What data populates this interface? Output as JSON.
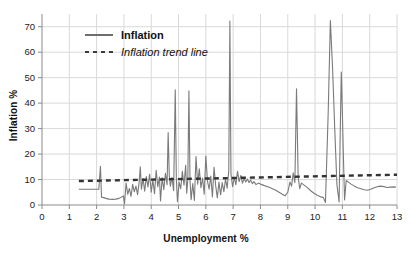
{
  "chart_data": {
    "type": "line",
    "title": "",
    "xlabel": "Unemployment %",
    "ylabel": "Inflation %",
    "xlim": [
      0,
      13
    ],
    "ylim": [
      0,
      75
    ],
    "xticks": [
      0,
      1,
      2,
      3,
      4,
      5,
      6,
      7,
      8,
      9,
      10,
      11,
      12,
      13
    ],
    "yticks": [
      0,
      10,
      20,
      30,
      40,
      50,
      60,
      70
    ],
    "grid": true,
    "legend_position": "upper-left",
    "legend": [
      {
        "label": "Inflation",
        "style": "solid",
        "color": "#6e6e6e",
        "weight": "bold"
      },
      {
        "label": "Inflation trend line",
        "style": "dotted",
        "color": "#3a3a3a",
        "weight": "italic"
      }
    ],
    "series": [
      {
        "name": "Inflation",
        "style": "solid",
        "color": "#7a7a7a",
        "points": [
          [
            1.35,
            6.2
          ],
          [
            1.55,
            6.2
          ],
          [
            1.75,
            6.2
          ],
          [
            1.95,
            6.2
          ],
          [
            2.08,
            6.2
          ],
          [
            2.14,
            15.2
          ],
          [
            2.18,
            3.1
          ],
          [
            2.26,
            2.9
          ],
          [
            2.34,
            2.6
          ],
          [
            2.45,
            2.3
          ],
          [
            2.58,
            2.2
          ],
          [
            2.7,
            2.3
          ],
          [
            2.82,
            2.6
          ],
          [
            2.93,
            3.2
          ],
          [
            2.98,
            3.6
          ],
          [
            3.02,
            0.4
          ],
          [
            3.08,
            8.6
          ],
          [
            3.14,
            4.2
          ],
          [
            3.2,
            6.5
          ],
          [
            3.26,
            3.4
          ],
          [
            3.32,
            8.1
          ],
          [
            3.38,
            5.2
          ],
          [
            3.44,
            7.4
          ],
          [
            3.5,
            4.1
          ],
          [
            3.56,
            9.2
          ],
          [
            3.6,
            15.0
          ],
          [
            3.64,
            6.2
          ],
          [
            3.7,
            10.4
          ],
          [
            3.76,
            5.4
          ],
          [
            3.82,
            11.2
          ],
          [
            3.88,
            7.1
          ],
          [
            3.94,
            12.1
          ],
          [
            4.0,
            5.0
          ],
          [
            4.06,
            9.8
          ],
          [
            4.12,
            4.4
          ],
          [
            4.18,
            13.6
          ],
          [
            4.24,
            7.2
          ],
          [
            4.3,
            11.0
          ],
          [
            4.34,
            1.6
          ],
          [
            4.4,
            10.8
          ],
          [
            4.46,
            6.0
          ],
          [
            4.52,
            12.4
          ],
          [
            4.58,
            8.0
          ],
          [
            4.62,
            28.4
          ],
          [
            4.66,
            12.0
          ],
          [
            4.7,
            7.4
          ],
          [
            4.76,
            10.9
          ],
          [
            4.82,
            5.6
          ],
          [
            4.88,
            45.2
          ],
          [
            4.92,
            10.2
          ],
          [
            4.96,
            1.3
          ],
          [
            5.02,
            9.0
          ],
          [
            5.08,
            6.4
          ],
          [
            5.14,
            13.2
          ],
          [
            5.2,
            7.8
          ],
          [
            5.26,
            15.6
          ],
          [
            5.3,
            4.6
          ],
          [
            5.34,
            10.0
          ],
          [
            5.38,
            44.8
          ],
          [
            5.42,
            9.5
          ],
          [
            5.46,
            2.1
          ],
          [
            5.52,
            8.4
          ],
          [
            5.58,
            1.8
          ],
          [
            5.64,
            19.0
          ],
          [
            5.7,
            8.2
          ],
          [
            5.76,
            14.2
          ],
          [
            5.82,
            6.8
          ],
          [
            5.88,
            10.6
          ],
          [
            5.94,
            4.2
          ],
          [
            6.0,
            19.2
          ],
          [
            6.06,
            9.4
          ],
          [
            6.12,
            6.2
          ],
          [
            6.18,
            11.4
          ],
          [
            6.24,
            3.2
          ],
          [
            6.3,
            14.8
          ],
          [
            6.36,
            7.6
          ],
          [
            6.42,
            2.8
          ],
          [
            6.48,
            9.0
          ],
          [
            6.54,
            4.0
          ],
          [
            6.6,
            8.8
          ],
          [
            6.66,
            5.2
          ],
          [
            6.72,
            10.2
          ],
          [
            6.78,
            6.6
          ],
          [
            6.84,
            13.4
          ],
          [
            6.88,
            72.2
          ],
          [
            6.92,
            12.0
          ],
          [
            6.98,
            7.2
          ],
          [
            7.04,
            10.8
          ],
          [
            7.1,
            8.0
          ],
          [
            7.16,
            13.2
          ],
          [
            7.22,
            9.2
          ],
          [
            7.28,
            11.6
          ],
          [
            7.34,
            8.6
          ],
          [
            7.4,
            10.4
          ],
          [
            7.46,
            9.0
          ],
          [
            7.52,
            10.2
          ],
          [
            7.58,
            8.8
          ],
          [
            7.64,
            9.8
          ],
          [
            7.7,
            8.4
          ],
          [
            7.76,
            9.2
          ],
          [
            7.84,
            8.0
          ],
          [
            7.92,
            8.6
          ],
          [
            8.0,
            8.2
          ],
          [
            8.1,
            7.8
          ],
          [
            8.2,
            7.4
          ],
          [
            8.32,
            7.0
          ],
          [
            8.44,
            6.4
          ],
          [
            8.56,
            5.8
          ],
          [
            8.68,
            5.0
          ],
          [
            8.8,
            4.2
          ],
          [
            8.9,
            3.6
          ],
          [
            9.0,
            5.0
          ],
          [
            9.08,
            9.0
          ],
          [
            9.14,
            7.4
          ],
          [
            9.2,
            12.6
          ],
          [
            9.26,
            8.8
          ],
          [
            9.32,
            45.6
          ],
          [
            9.38,
            11.0
          ],
          [
            9.44,
            6.4
          ],
          [
            9.5,
            8.6
          ],
          [
            9.6,
            7.8
          ],
          [
            9.72,
            6.8
          ],
          [
            9.84,
            5.6
          ],
          [
            9.96,
            4.6
          ],
          [
            10.08,
            3.8
          ],
          [
            10.2,
            3.2
          ],
          [
            10.3,
            3.0
          ],
          [
            10.38,
            1.0
          ],
          [
            10.48,
            36.0
          ],
          [
            10.56,
            72.4
          ],
          [
            10.64,
            54.0
          ],
          [
            10.72,
            30.0
          ],
          [
            10.8,
            8.0
          ],
          [
            10.88,
            1.2
          ],
          [
            10.92,
            28.0
          ],
          [
            10.96,
            52.2
          ],
          [
            11.0,
            36.0
          ],
          [
            11.04,
            18.0
          ],
          [
            11.08,
            2.0
          ],
          [
            11.14,
            9.6
          ],
          [
            11.22,
            9.0
          ],
          [
            11.32,
            8.2
          ],
          [
            11.44,
            7.4
          ],
          [
            11.56,
            6.8
          ],
          [
            11.68,
            6.4
          ],
          [
            11.8,
            6.0
          ],
          [
            11.92,
            5.8
          ],
          [
            12.04,
            6.2
          ],
          [
            12.16,
            6.8
          ],
          [
            12.28,
            7.2
          ],
          [
            12.4,
            7.4
          ],
          [
            12.52,
            7.2
          ],
          [
            12.64,
            6.9
          ],
          [
            12.76,
            7.0
          ],
          [
            12.88,
            7.1
          ],
          [
            12.96,
            7.0
          ]
        ]
      },
      {
        "name": "Inflation trend line",
        "style": "dotted",
        "color": "#333333",
        "points": [
          [
            1.35,
            9.4
          ],
          [
            13.0,
            11.9
          ]
        ]
      }
    ]
  },
  "axes": {
    "x_title": "Unemployment %",
    "y_title": "Inflation %",
    "x_tick_labels": [
      "0",
      "1",
      "2",
      "3",
      "4",
      "5",
      "6",
      "7",
      "8",
      "9",
      "10",
      "11",
      "12",
      "13"
    ],
    "y_tick_labels": [
      "0",
      "10",
      "20",
      "30",
      "40",
      "50",
      "60",
      "70"
    ]
  },
  "colors": {
    "series_line": "#7a7a7a",
    "trend_line": "#333333",
    "grid": "#d9d9d9",
    "axis": "#8a8a8a",
    "text": "#111111",
    "background": "#ffffff"
  }
}
